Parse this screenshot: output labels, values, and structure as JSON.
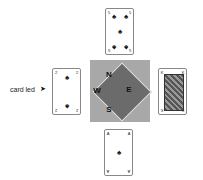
{
  "compass": {
    "north": "N",
    "south": "S",
    "east": "E",
    "west": "W"
  },
  "label": {
    "text": "card led",
    "arrow": "➤"
  },
  "cards": {
    "north": {
      "rank": "5",
      "suit": "♠"
    },
    "west": {
      "rank": "2",
      "suit": "♠"
    },
    "east": {
      "rank": "K",
      "suit": "♠"
    },
    "south": {
      "rank": "A",
      "suit": "♠"
    }
  },
  "colors": {
    "square": "#a8a8a8",
    "diamond": "#6b6b6b"
  }
}
